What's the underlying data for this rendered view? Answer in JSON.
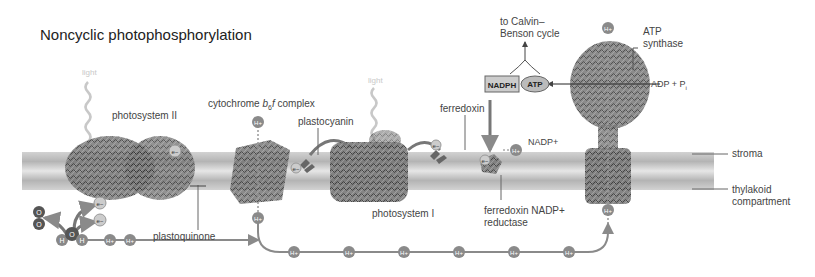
{
  "title": "Noncyclic photophosphorylation",
  "labels": {
    "light_1": "light",
    "light_2": "light",
    "photosystem_ii": "photosystem II",
    "cytochrome": "cytochrome",
    "cytochrome_b": "b",
    "cytochrome_sub": "6",
    "cytochrome_f": "f",
    "cytochrome_tail": " complex",
    "plastocyanin": "plastocyanin",
    "plastoquinone": "plastoquinone",
    "photosystem_i": "photosystem I",
    "ferredoxin": "ferredoxin",
    "fnr_line1": "ferredoxin NADP+",
    "fnr_line2": "reductase",
    "nadp": "NADP+",
    "calvin_line1": "to Calvin–",
    "calvin_line2": "Benson cycle",
    "atp_synthase_line1": "ATP",
    "atp_synthase_line2": "synthase",
    "adp_pi": "ADP + P",
    "adp_pi_sub": "i",
    "stroma": "stroma",
    "thylakoid_line1": "thylakoid",
    "thylakoid_line2": "compartment"
  },
  "molecules": {
    "nadph": "NADPH",
    "atp": "ATP",
    "proton": "H+",
    "electron": "e−",
    "oxygen": "O",
    "hydrogen": "H"
  },
  "colors": {
    "membrane": "#c9c9c9",
    "membrane_dark": "#a8a8a8",
    "proton_circle": "#8a8a8a",
    "arrow": "#8a8a8a",
    "protein": "#555555",
    "text": "#444444"
  }
}
